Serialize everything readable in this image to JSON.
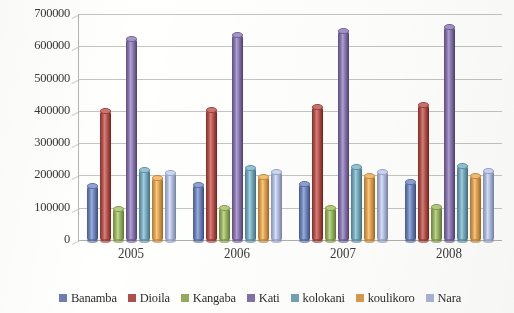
{
  "chart_data": {
    "type": "bar",
    "title": "",
    "subtitle": "",
    "xlabel": "",
    "ylabel": "",
    "categories": [
      "2005",
      "2006",
      "2007",
      "2008"
    ],
    "ylim": [
      0,
      700000
    ],
    "yticks": [
      0,
      100000,
      200000,
      300000,
      400000,
      500000,
      600000,
      700000
    ],
    "ytick_labels": [
      "0",
      "100000",
      "200000",
      "300000",
      "400000",
      "500000",
      "600000",
      "700000"
    ],
    "grid": true,
    "legend_position": "bottom",
    "orientation": "vertical",
    "bar_style": "cylinder-3d",
    "series": [
      {
        "name": "Banamba",
        "color": "#6a7fb5",
        "values": [
          175000,
          178000,
          180000,
          186000
        ]
      },
      {
        "name": "Dioila",
        "color": "#b0504a",
        "values": [
          405000,
          410000,
          418000,
          424000
        ]
      },
      {
        "name": "Kangaba",
        "color": "#91ab5a",
        "values": [
          103000,
          104000,
          105000,
          108000
        ]
      },
      {
        "name": "Kati",
        "color": "#8271a8",
        "values": [
          628000,
          641000,
          654000,
          666000
        ]
      },
      {
        "name": "kolokani",
        "color": "#6fa2b4",
        "values": [
          224000,
          230000,
          231000,
          236000
        ]
      },
      {
        "name": "koulikoro",
        "color": "#d79a4a",
        "values": [
          199000,
          201000,
          203000,
          206000
        ]
      },
      {
        "name": "Nara",
        "color": "#a8b4d6",
        "values": [
          213000,
          216000,
          218000,
          221000
        ]
      }
    ]
  },
  "legend": {
    "items": [
      {
        "label": "Banamba"
      },
      {
        "label": "Dioila"
      },
      {
        "label": "Kangaba"
      },
      {
        "label": "Kati"
      },
      {
        "label": "kolokani"
      },
      {
        "label": "koulikoro"
      },
      {
        "label": "Nara"
      }
    ]
  }
}
